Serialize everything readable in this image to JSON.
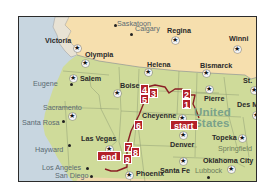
{
  "map": {
    "colors": {
      "ocean": "#c8d6e0",
      "canada": "#f6dfae",
      "usa": "#cfdb9a",
      "route": "#8a1f25",
      "marker": "#b3202a",
      "country_label": "#7aa28a"
    },
    "country_label": [
      "United",
      "States"
    ],
    "cities": [
      {
        "name": "Saskatoon",
        "type": "dot"
      },
      {
        "name": "Calgary",
        "type": "dot"
      },
      {
        "name": "Regina",
        "type": "capital"
      },
      {
        "name": "Winni",
        "type": "capital"
      },
      {
        "name": "Victoria",
        "type": "capital"
      },
      {
        "name": "Olympia",
        "type": "capital"
      },
      {
        "name": "Salem",
        "type": "capital"
      },
      {
        "name": "Eugene",
        "type": "dot"
      },
      {
        "name": "Helena",
        "type": "capital"
      },
      {
        "name": "Bismarck",
        "type": "capital"
      },
      {
        "name": "St.",
        "type": "capital"
      },
      {
        "name": "Pierre",
        "type": "capital"
      },
      {
        "name": "Des M",
        "type": "capital"
      },
      {
        "name": "Boise",
        "type": "capital"
      },
      {
        "name": "Sacramento",
        "type": "capital"
      },
      {
        "name": "Santa Rosa",
        "type": "dot"
      },
      {
        "name": "Las Vegas",
        "type": "city"
      },
      {
        "name": "Hayward",
        "type": "dot"
      },
      {
        "name": "Los Angeles",
        "type": "dot"
      },
      {
        "name": "San Diego",
        "type": "dot"
      },
      {
        "name": "Cheyenne",
        "type": "capital"
      },
      {
        "name": "Denver",
        "type": "capital"
      },
      {
        "name": "Topeka",
        "type": "capital"
      },
      {
        "name": "Springfield",
        "type": "dot"
      },
      {
        "name": "Oklahoma City",
        "type": "capital"
      },
      {
        "name": "Santa Fe",
        "type": "capital"
      },
      {
        "name": "Lubbock",
        "type": "dot"
      },
      {
        "name": "Phoenix",
        "type": "capital"
      }
    ],
    "route_markers": [
      "start",
      "1",
      "2",
      "3",
      "4",
      "5",
      "6",
      "7",
      "8",
      "9",
      "end"
    ]
  }
}
